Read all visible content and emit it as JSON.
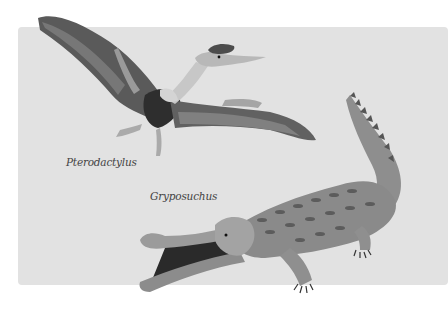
{
  "illustration": {
    "background": "#e2e2e2",
    "creatures": [
      {
        "name": "Pterodactylus",
        "type": "pterosaur"
      },
      {
        "name": "Gryposuchus",
        "type": "gavialoid-crocodilian"
      }
    ]
  },
  "labels": {
    "pterodactylus": "Pterodactylus",
    "gryposuchus": "Gryposuchus"
  }
}
